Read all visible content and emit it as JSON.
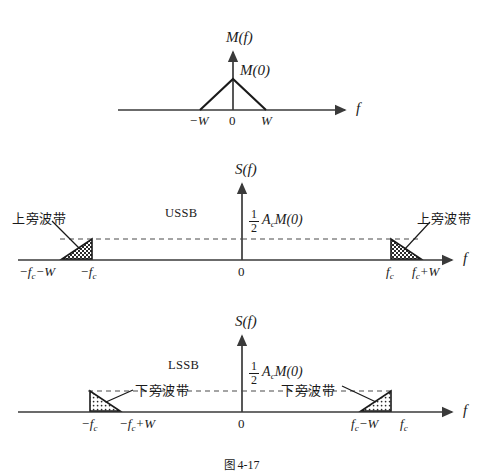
{
  "figure": {
    "caption_cjk": "图",
    "caption_number": "4-17",
    "caption_full": "图 4-17"
  },
  "panels": [
    {
      "id": "baseband-spectrum",
      "vertical_axis_label": "M(f)",
      "horizontal_axis_label": "f",
      "peak_label": "M(0)",
      "ticks": [
        {
          "name": "neg-w",
          "text": "−W"
        },
        {
          "name": "zero",
          "text": "0"
        },
        {
          "name": "pos-w",
          "text": "W"
        }
      ]
    },
    {
      "id": "ussb-spectrum",
      "vertical_axis_label": "S(f)",
      "horizontal_axis_label": "f",
      "mode_label": "USSB",
      "amplitude_numerator": "1",
      "amplitude_denominator": "2",
      "amplitude_expression": "A",
      "amplitude_subscript": "c",
      "amplitude_tail": "M(0)",
      "sideband_label_left": "上旁波带",
      "sideband_label_right": "上旁波带",
      "ticks": [
        {
          "name": "neg-fc-minus-w",
          "base": "−f",
          "sub": "c",
          "tail": "−W"
        },
        {
          "name": "neg-fc",
          "base": "−f",
          "sub": "c",
          "tail": ""
        },
        {
          "name": "zero",
          "base": "0",
          "sub": "",
          "tail": ""
        },
        {
          "name": "pos-fc",
          "base": "f",
          "sub": "c",
          "tail": ""
        },
        {
          "name": "pos-fc-plus-w",
          "base": "f",
          "sub": "c",
          "tail": "+W"
        }
      ]
    },
    {
      "id": "lssb-spectrum",
      "vertical_axis_label": "S(f)",
      "horizontal_axis_label": "f",
      "mode_label": "LSSB",
      "amplitude_numerator": "1",
      "amplitude_denominator": "2",
      "amplitude_expression": "A",
      "amplitude_subscript": "c",
      "amplitude_tail": "M(0)",
      "sideband_label_left": "下旁波带",
      "sideband_label_right": "下旁波带",
      "ticks": [
        {
          "name": "neg-fc",
          "base": "−f",
          "sub": "c",
          "tail": ""
        },
        {
          "name": "neg-fc-plus-w",
          "base": "−f",
          "sub": "c",
          "tail": "+W"
        },
        {
          "name": "zero",
          "base": "0",
          "sub": "",
          "tail": ""
        },
        {
          "name": "pos-fc-minus-w",
          "base": "f",
          "sub": "c",
          "tail": "−W"
        },
        {
          "name": "pos-fc",
          "base": "f",
          "sub": "c",
          "tail": ""
        }
      ]
    }
  ],
  "colors": {
    "ink": "#1a1a1a",
    "axis": "#3a3a3a",
    "dashed": "#4a4a4a",
    "fill_dark": "#2b2b2b",
    "background": "#ffffff"
  }
}
